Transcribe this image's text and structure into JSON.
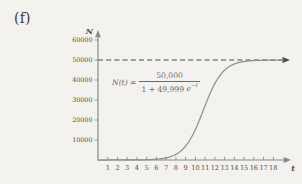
{
  "figure": {
    "part_label": "(f)",
    "equation": {
      "lhs": "N(t) =",
      "numerator": "50,000",
      "denominator_prefix": "1 + 49,999",
      "denominator_exp_base": "e",
      "denominator_exp_power": "−t"
    }
  },
  "chart_data": {
    "type": "line",
    "title": "",
    "subtitle": "",
    "xlabel": "t",
    "ylabel": "N",
    "grid": false,
    "legend": null,
    "xlim": [
      0,
      19.2
    ],
    "ylim": [
      0,
      62000
    ],
    "x_ticks": [
      1,
      2,
      3,
      4,
      5,
      6,
      7,
      8,
      9,
      10,
      11,
      12,
      13,
      14,
      15,
      16,
      17,
      18
    ],
    "x_tick_labels": [
      "1",
      "2",
      "3",
      "4",
      "5",
      "6",
      "7",
      "8",
      "9",
      "10",
      "11",
      "12",
      "13",
      "14",
      "15",
      "16",
      "17",
      "18"
    ],
    "y_ticks": [
      10000,
      20000,
      30000,
      40000,
      50000,
      60000
    ],
    "y_tick_labels": [
      "10000",
      "20000",
      "30000",
      "40000",
      "50000",
      "60000"
    ],
    "annotations": [
      {
        "name": "asymptote",
        "kind": "horizontal-dashed-line",
        "y": 50000,
        "label": "carrying capacity"
      },
      {
        "name": "equation-annotation",
        "kind": "text",
        "text": "N(t) = 50,000 / (1 + 49,999 e^(-t))",
        "x": 5.5,
        "y": 36000
      }
    ],
    "series": [
      {
        "name": "N(t)",
        "color": "#8f8f8f",
        "formula": "50000 / (1 + 49999 * exp(-t))",
        "x": [
          0,
          1,
          2,
          3,
          4,
          5,
          6,
          7,
          8,
          9,
          10,
          10.5,
          11,
          11.5,
          12,
          12.5,
          13,
          14,
          15,
          16,
          17,
          18,
          19
        ],
        "values": [
          1,
          3,
          7,
          20,
          55,
          148,
          403,
          1089,
          2859,
          7053,
          15385,
          20761,
          26894,
          33333,
          39326,
          44444,
          48387,
          50000,
          50000,
          50000,
          50000,
          50000,
          50000
        ]
      }
    ],
    "colors": {
      "curve": "#8f8f8f",
      "axis": "#8a8a8a",
      "asymptote": "#4a4a4a",
      "text": "#4d4d4d",
      "background": "#f4f2ef"
    }
  }
}
